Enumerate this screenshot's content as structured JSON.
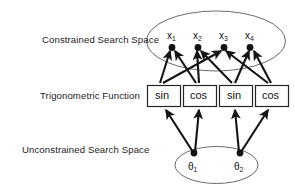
{
  "figure": {
    "type": "diagram",
    "background_color": "#ffffff",
    "stroke_color": "#1a1a1a",
    "ellipse_stroke_color": "#555555",
    "box_fill_color": "#ffffff"
  },
  "layers": {
    "constrained": {
      "label": "Constrained Search Space",
      "nodes": [
        {
          "name": "x",
          "sub": "1"
        },
        {
          "name": "x",
          "sub": "2"
        },
        {
          "name": "x",
          "sub": "3"
        },
        {
          "name": "x",
          "sub": "4"
        }
      ]
    },
    "trigonometric": {
      "label": "Trigonometric Function",
      "boxes": [
        {
          "text": "sin"
        },
        {
          "text": "cos"
        },
        {
          "text": "sin"
        },
        {
          "text": "cos"
        }
      ]
    },
    "unconstrained": {
      "label": "Unconstrained Search Space",
      "nodes": [
        {
          "name": "θ",
          "sub": "1"
        },
        {
          "name": "θ",
          "sub": "2"
        }
      ]
    }
  },
  "edges": {
    "theta_to_box": [
      {
        "from": "theta1",
        "to": "sin-1"
      },
      {
        "from": "theta1",
        "to": "cos-2"
      },
      {
        "from": "theta2",
        "to": "sin-3"
      },
      {
        "from": "theta2",
        "to": "cos-4"
      }
    ],
    "box_to_x": [
      {
        "from": "sin-1",
        "to": "x1"
      },
      {
        "from": "sin-1",
        "to": "x3"
      },
      {
        "from": "cos-2",
        "to": "x1"
      },
      {
        "from": "cos-2",
        "to": "x2"
      },
      {
        "from": "sin-3",
        "to": "x2"
      },
      {
        "from": "sin-3",
        "to": "x4"
      },
      {
        "from": "cos-4",
        "to": "x3"
      },
      {
        "from": "cos-4",
        "to": "x4"
      }
    ]
  }
}
